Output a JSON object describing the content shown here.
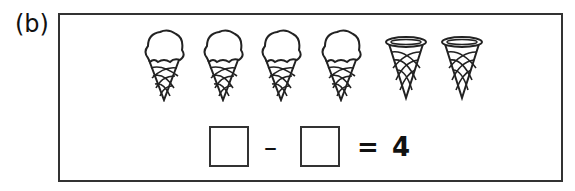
{
  "label": "(b)",
  "picture": {
    "full_cones": 4,
    "empty_cones": 2,
    "items": [
      "ice-cream-cone",
      "ice-cream-cone",
      "ice-cream-cone",
      "ice-cream-cone",
      "empty-cone",
      "empty-cone"
    ]
  },
  "equation": {
    "operator": "–",
    "equals": "=",
    "result": "4",
    "blank1": "",
    "blank2": ""
  }
}
